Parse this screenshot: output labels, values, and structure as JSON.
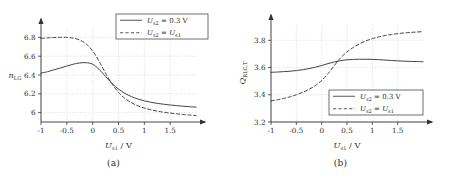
{
  "figure": {
    "panels": [
      {
        "id": "a",
        "caption": "(a)",
        "legend_position": "top-right",
        "ylabel_text": "n",
        "ylabel_sub": "LG",
        "ylabel_rotated": false,
        "xlabel_var": "U",
        "xlabel_sub": "s1",
        "xlabel_unit": "/ V"
      },
      {
        "id": "b",
        "caption": "(b)",
        "legend_position": "bottom-right",
        "ylabel_text": "Q",
        "ylabel_sub": "RLC,T",
        "ylabel_rotated": true,
        "xlabel_var": "U",
        "xlabel_sub": "s1",
        "xlabel_unit": "/ V"
      }
    ],
    "legend": {
      "entries": [
        {
          "style": "solid",
          "var": "U",
          "sub": "s2",
          "eq": "=",
          "value": "0.3",
          "unit": "V"
        },
        {
          "style": "dashed",
          "var": "U",
          "sub": "s2",
          "eq": "=",
          "value_var": "U",
          "value_sub": "s1"
        }
      ]
    },
    "colors": {
      "curve": "#444444",
      "axis": "#333333",
      "grid": "#c8c8c8",
      "text": "#2b2b2b",
      "background": "#ffffff"
    }
  },
  "chart_data": [
    {
      "type": "line",
      "title": "(a)",
      "xlabel": "U_s1 / V",
      "ylabel": "n_LG",
      "xlim": [
        -1,
        2
      ],
      "ylim": [
        5.9,
        6.9
      ],
      "xticks": [
        -1,
        -0.5,
        0,
        0.5,
        1,
        1.5
      ],
      "xticklabels": [
        "-1",
        "-0.5",
        "0",
        "0.5",
        "1",
        "1.5"
      ],
      "yticks": [
        6,
        6.2,
        6.4,
        6.6,
        6.8
      ],
      "yticklabels": [
        "6",
        "6.2",
        "6.4",
        "6.6",
        "6.8"
      ],
      "grid": true,
      "legend_position": "upper right",
      "series": [
        {
          "name": "U_s2 = 0.3 V",
          "style": "solid",
          "x": [
            -1,
            -0.875,
            -0.75,
            -0.625,
            -0.5,
            -0.375,
            -0.25,
            -0.125,
            0,
            0.125,
            0.25,
            0.375,
            0.5,
            0.625,
            0.75,
            0.875,
            1,
            1.125,
            1.25,
            1.375,
            1.5,
            1.625,
            1.75,
            1.875,
            2
          ],
          "y": [
            6.42,
            6.435,
            6.455,
            6.475,
            6.495,
            6.515,
            6.528,
            6.531,
            6.515,
            6.46,
            6.385,
            6.31,
            6.25,
            6.205,
            6.17,
            6.145,
            6.125,
            6.11,
            6.098,
            6.089,
            6.081,
            6.074,
            6.068,
            6.063,
            6.058
          ]
        },
        {
          "name": "U_s2 = U_s1",
          "style": "dashed",
          "x": [
            -1,
            -0.875,
            -0.75,
            -0.625,
            -0.5,
            -0.375,
            -0.25,
            -0.125,
            0,
            0.125,
            0.25,
            0.375,
            0.5,
            0.625,
            0.75,
            0.875,
            1,
            1.125,
            1.25,
            1.375,
            1.5,
            1.625,
            1.75,
            1.875,
            2
          ],
          "y": [
            6.79,
            6.795,
            6.799,
            6.801,
            6.8,
            6.792,
            6.772,
            6.73,
            6.655,
            6.545,
            6.42,
            6.305,
            6.215,
            6.15,
            6.105,
            6.072,
            6.048,
            6.03,
            6.016,
            6.004,
            5.995,
            5.987,
            5.98,
            5.974,
            5.968
          ]
        }
      ]
    },
    {
      "type": "line",
      "title": "(b)",
      "xlabel": "U_s1 / V",
      "ylabel": "Q_RLC,T",
      "xlim": [
        -1,
        2
      ],
      "ylim": [
        3.2,
        3.92
      ],
      "xticks": [
        -1,
        -0.5,
        0,
        0.5,
        1,
        1.5
      ],
      "xticklabels": [
        "-1",
        "-0.5",
        "0",
        "0.5",
        "1",
        "1.5"
      ],
      "yticks": [
        3.2,
        3.4,
        3.6,
        3.8
      ],
      "yticklabels": [
        "3.2",
        "3.4",
        "3.6",
        "3.8"
      ],
      "grid": true,
      "legend_position": "lower right",
      "series": [
        {
          "name": "U_s2 = 0.3 V",
          "style": "solid",
          "x": [
            -1,
            -0.875,
            -0.75,
            -0.625,
            -0.5,
            -0.375,
            -0.25,
            -0.125,
            0,
            0.125,
            0.25,
            0.375,
            0.5,
            0.625,
            0.75,
            0.875,
            1,
            1.125,
            1.25,
            1.375,
            1.5,
            1.625,
            1.75,
            1.875,
            2
          ],
          "y": [
            3.565,
            3.567,
            3.57,
            3.573,
            3.578,
            3.584,
            3.592,
            3.603,
            3.615,
            3.629,
            3.641,
            3.651,
            3.657,
            3.66,
            3.661,
            3.661,
            3.66,
            3.658,
            3.655,
            3.652,
            3.649,
            3.647,
            3.645,
            3.644,
            3.643
          ]
        },
        {
          "name": "U_s2 = U_s1",
          "style": "dashed",
          "x": [
            -1,
            -0.875,
            -0.75,
            -0.625,
            -0.5,
            -0.375,
            -0.25,
            -0.125,
            0,
            0.125,
            0.25,
            0.375,
            0.5,
            0.625,
            0.75,
            0.875,
            1,
            1.125,
            1.25,
            1.375,
            1.5,
            1.625,
            1.75,
            1.875,
            2
          ],
          "y": [
            3.355,
            3.363,
            3.373,
            3.385,
            3.4,
            3.418,
            3.44,
            3.468,
            3.505,
            3.555,
            3.615,
            3.672,
            3.715,
            3.748,
            3.775,
            3.796,
            3.812,
            3.825,
            3.835,
            3.843,
            3.849,
            3.854,
            3.858,
            3.861,
            3.864
          ]
        }
      ]
    }
  ]
}
